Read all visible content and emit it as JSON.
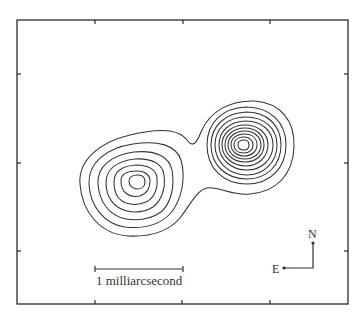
{
  "figure": {
    "scale_bar_label": "1 milliarcsecond",
    "compass": {
      "north_label": "N",
      "east_label": "E"
    }
  },
  "chart_data": {
    "type": "contour",
    "title": "",
    "frame": {
      "x0": 17,
      "y0": 20,
      "x1": 348,
      "y1": 304
    },
    "ticks": {
      "top": [
        95,
        183,
        270
      ],
      "bottom": [
        95,
        182,
        270
      ],
      "left": [
        74,
        163,
        251
      ],
      "right": [
        74,
        163,
        251
      ]
    },
    "components": [
      {
        "name": "western component (fainter)",
        "center": [
          137,
          181
        ],
        "contour_count": 7
      },
      {
        "name": "eastern component (brighter)",
        "center": [
          243,
          144
        ],
        "contour_count": 11
      }
    ],
    "scale_bar": {
      "x0": 95,
      "x1": 183,
      "y": 269,
      "label": "1 milliarcsecond"
    },
    "compass": {
      "origin": [
        313,
        268
      ],
      "north_tip": [
        313,
        243
      ],
      "east_tip": [
        284,
        268
      ]
    },
    "colors": {
      "line": "#333333",
      "background": "#ffffff"
    }
  }
}
